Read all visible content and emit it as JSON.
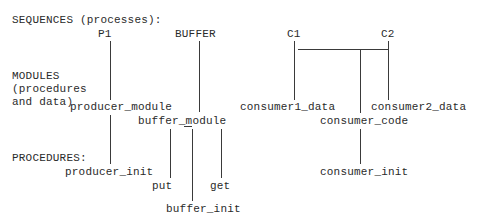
{
  "diagram": {
    "rows": {
      "sequences": "SEQUENCES (processes):",
      "modules_line1": "MODULES",
      "modules_line2": "(procedures",
      "modules_line3": "and data)",
      "procedures": "PROCEDURES:"
    },
    "sequences": [
      "P1",
      "BUFFER",
      "C1",
      "C2"
    ],
    "modules": [
      "producer_module",
      "buffer_module",
      "consumer1_data",
      "consumer_code",
      "consumer2_data"
    ],
    "procedures": [
      "producer_init",
      "put",
      "get",
      "buffer_init",
      "consumer_init"
    ]
  }
}
